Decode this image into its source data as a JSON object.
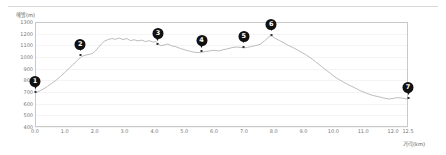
{
  "chart_data": {
    "type": "line",
    "title": "",
    "xlabel": "거리(km)",
    "ylabel": "해발(m)",
    "xlim": [
      0.0,
      12.5
    ],
    "ylim": [
      400,
      1300
    ],
    "grid": true,
    "legend": "none",
    "yticks": [
      1300,
      1200,
      1100,
      1000,
      900,
      800,
      700,
      600,
      500,
      400
    ],
    "ytick_labels": [
      "1300",
      "1200",
      "1100",
      "1000",
      "900",
      "800",
      "700",
      "600",
      "500",
      "400"
    ],
    "xticks": [
      0.0,
      1.0,
      2.0,
      3.0,
      4.0,
      5.0,
      6.0,
      7.0,
      8.0,
      9.0,
      10.0,
      11.0,
      12.0,
      12.5
    ],
    "xtick_labels": [
      "0.0",
      "1.0",
      "2.0",
      "3.0",
      "4.0",
      "5.0",
      "6.0",
      "7.0",
      "8.0",
      "9.0",
      "10.0",
      "11.0",
      "12.0",
      "12.5"
    ],
    "series": [
      {
        "name": "elevation",
        "color": "#b4b4b4",
        "x": [
          0.0,
          0.08,
          0.18,
          0.3,
          0.42,
          0.55,
          0.7,
          0.85,
          1.0,
          1.15,
          1.3,
          1.42,
          1.52,
          1.62,
          1.72,
          1.82,
          1.92,
          2.02,
          2.12,
          2.22,
          2.32,
          2.45,
          2.58,
          2.7,
          2.82,
          2.95,
          3.08,
          3.2,
          3.32,
          3.45,
          3.58,
          3.7,
          3.82,
          3.95,
          4.05,
          4.12,
          4.2,
          4.32,
          4.45,
          4.58,
          4.72,
          4.88,
          5.02,
          5.18,
          5.32,
          5.45,
          5.58,
          5.7,
          5.85,
          6.0,
          6.15,
          6.3,
          6.45,
          6.6,
          6.75,
          6.9,
          7.0,
          7.12,
          7.25,
          7.4,
          7.55,
          7.7,
          7.85,
          7.92,
          8.05,
          8.2,
          8.35,
          8.5,
          8.65,
          8.8,
          8.95,
          9.1,
          9.25,
          9.4,
          9.55,
          9.72,
          9.9,
          10.1,
          10.3,
          10.5,
          10.7,
          10.9,
          11.1,
          11.3,
          11.5,
          11.7,
          11.85,
          12.0,
          12.15,
          12.3,
          12.42,
          12.5
        ],
        "y": [
          690,
          700,
          712,
          728,
          748,
          772,
          800,
          832,
          868,
          905,
          940,
          972,
          995,
          1010,
          1018,
          1022,
          1030,
          1050,
          1080,
          1110,
          1135,
          1150,
          1158,
          1152,
          1162,
          1150,
          1158,
          1140,
          1148,
          1138,
          1145,
          1132,
          1140,
          1128,
          1132,
          1118,
          1098,
          1102,
          1112,
          1095,
          1088,
          1072,
          1062,
          1050,
          1042,
          1038,
          1040,
          1046,
          1052,
          1058,
          1052,
          1062,
          1070,
          1080,
          1086,
          1082,
          1078,
          1082,
          1090,
          1098,
          1110,
          1140,
          1175,
          1182,
          1160,
          1140,
          1120,
          1098,
          1080,
          1060,
          1038,
          1015,
          990,
          960,
          930,
          895,
          860,
          820,
          790,
          762,
          738,
          712,
          690,
          672,
          660,
          648,
          640,
          645,
          652,
          648,
          642,
          638
        ]
      }
    ],
    "markers": [
      {
        "id": "1",
        "label": "1",
        "x": 0.0,
        "y": 690
      },
      {
        "id": "2",
        "label": "2",
        "x": 1.52,
        "y": 1010
      },
      {
        "id": "3",
        "label": "3",
        "x": 4.12,
        "y": 1102
      },
      {
        "id": "4",
        "label": "4",
        "x": 5.58,
        "y": 1040
      },
      {
        "id": "5",
        "label": "5",
        "x": 7.0,
        "y": 1078
      },
      {
        "id": "6",
        "label": "6",
        "x": 7.92,
        "y": 1182
      },
      {
        "id": "7",
        "label": "7",
        "x": 12.5,
        "y": 638
      }
    ]
  }
}
